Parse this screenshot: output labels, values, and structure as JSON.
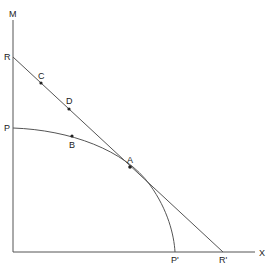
{
  "diagram": {
    "type": "production-possibility-frontier with tangent budget line",
    "axes": {
      "x_label": "X",
      "y_label": "M"
    },
    "curve": {
      "name": "PP'",
      "start_label": "P",
      "end_label": "P'"
    },
    "line": {
      "name": "RR'",
      "start_label": "R",
      "end_label": "R'"
    },
    "points": [
      {
        "label": "A",
        "on": "curve and line (tangency)"
      },
      {
        "label": "B",
        "on": "curve"
      },
      {
        "label": "C",
        "on": "line"
      },
      {
        "label": "D",
        "on": "line"
      }
    ],
    "colors": {
      "stroke": "#555555",
      "text": "#222222",
      "background": "#ffffff"
    }
  }
}
